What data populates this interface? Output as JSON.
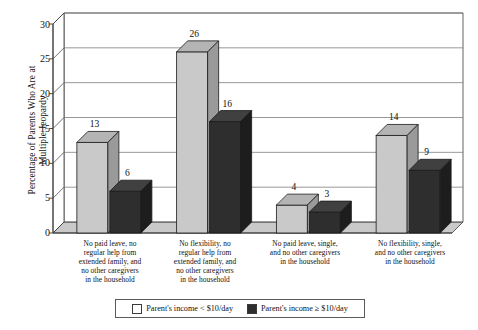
{
  "chart_data": {
    "type": "bar",
    "title": "",
    "subtitle": "",
    "xlabel": "",
    "ylabel": "Percentage of Parents Who Are at\nMultiple Jeopardy",
    "ylim": [
      0,
      30
    ],
    "yticks": [
      0,
      5,
      10,
      15,
      20,
      25,
      30
    ],
    "ytick_labels": [
      "0",
      "5",
      "10",
      "15",
      "20",
      "25",
      "30"
    ],
    "grid": true,
    "grid_axis": "y",
    "legend_position": "bottom",
    "style": "3d-grouped-bars",
    "categories": [
      "No paid leave, no\nregular help from\nextended family, and\nno other caregivers\nin the household",
      "No flexibility, no\nregular help from\nextended family, and\nno other caregivers\nin the household",
      "No paid leave, single,\nand no other caregivers\nin the household",
      "No flexibility, single,\nand no other caregivers\nin the household"
    ],
    "series": [
      {
        "name": "Parent's income < $10/day",
        "color": "#c9c9c9",
        "side_color": "#9a9a9a",
        "top_color": "#b4b4b4",
        "values": [
          13,
          26,
          4,
          14
        ],
        "value_labels": [
          "13",
          "26",
          "4",
          "14"
        ]
      },
      {
        "name": "Parent's income ≥ $10/day",
        "color": "#2e2e2e",
        "side_color": "#1d1d1d",
        "top_color": "#404040",
        "values": [
          6,
          16,
          3,
          9
        ],
        "value_labels": [
          "6",
          "16",
          "3",
          "9"
        ]
      }
    ]
  },
  "legend": {
    "items": [
      {
        "label": "Parent's income < $10/day",
        "swatch": "light"
      },
      {
        "label": "Parent's income ≥ $10/day",
        "swatch": "dark"
      }
    ]
  },
  "colors": {
    "background": "#ffffff",
    "axis": "#3a3a3a",
    "grid": "#7d7d7d",
    "wall": "#ffffff",
    "floor": "#c9c9c9",
    "text": "#111111"
  }
}
